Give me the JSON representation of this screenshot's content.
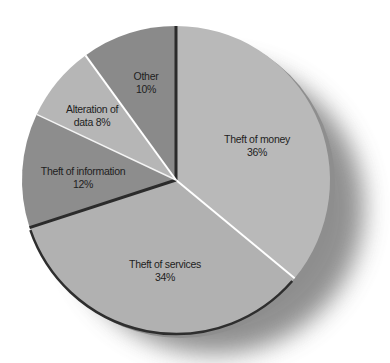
{
  "chart_data": {
    "type": "pie",
    "title": "",
    "start_angle_deg": 0,
    "direction": "clockwise",
    "slices": [
      {
        "label": "Theft of money",
        "value": 36,
        "display": "Theft of money 36%",
        "color": "#b9b9b9"
      },
      {
        "label": "Theft of services",
        "value": 34,
        "display": "Theft of services 34%",
        "color": "#b1b1b1"
      },
      {
        "label": "Theft of information",
        "value": 12,
        "display": "Theft of information 12%",
        "color": "#8d8d8d"
      },
      {
        "label": "Alteration of data",
        "value": 8,
        "display": "Alteration of data 8%",
        "color": "#b6b6b6"
      },
      {
        "label": "Other",
        "value": 10,
        "display": "Other 10%",
        "color": "#8a8a8a"
      }
    ],
    "legend": "none (labels inside slices)",
    "units": "%"
  },
  "labels": {
    "money": {
      "line1": "Theft of money",
      "line2": "36%"
    },
    "services": {
      "line1": "Theft of services",
      "line2": "34%"
    },
    "information": {
      "line1": "Theft of information",
      "line2": "12%"
    },
    "alteration": {
      "line1": "Alteration of",
      "line2": "data 8%"
    },
    "other": {
      "line1": "Other",
      "line2": "10%"
    }
  }
}
